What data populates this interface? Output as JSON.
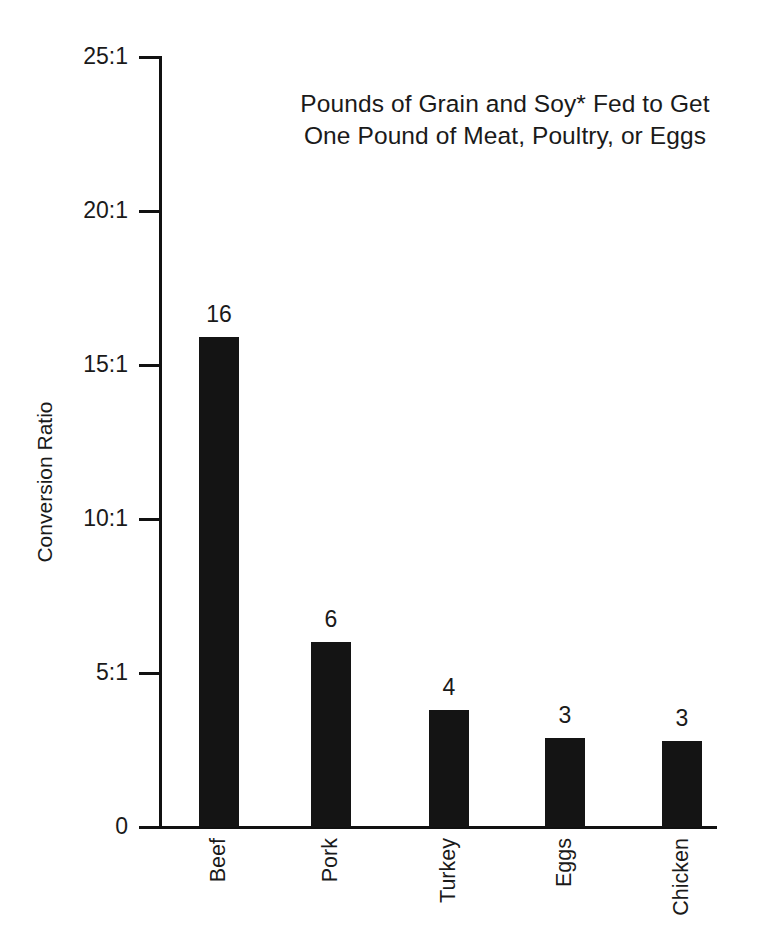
{
  "chart_data": {
    "type": "bar",
    "title": "Pounds of Grain and Soy* Fed to Get\nOne Pound of Meat, Poultry, or Eggs",
    "xlabel": "",
    "ylabel": "Conversion Ratio",
    "categories": [
      "Beef",
      "Pork",
      "Turkey",
      "Eggs",
      "Chicken"
    ],
    "values": [
      16,
      6,
      4,
      3,
      3
    ],
    "bar_pixel_values": [
      15.9,
      6.0,
      3.8,
      2.9,
      2.8
    ],
    "data_labels": [
      "16",
      "6",
      "4",
      "3",
      "3"
    ],
    "ylim": [
      0,
      25
    ],
    "ytick_values": [
      25,
      20,
      15,
      10,
      5,
      0
    ],
    "ytick_labels": [
      "25:1",
      "20:1",
      "15:1",
      "10:1",
      "5:1",
      "0"
    ],
    "grid": false,
    "legend": false,
    "bar_color": "#141414",
    "axis_color": "#111111",
    "text_color": "#1a1a1a",
    "background": "#ffffff"
  }
}
